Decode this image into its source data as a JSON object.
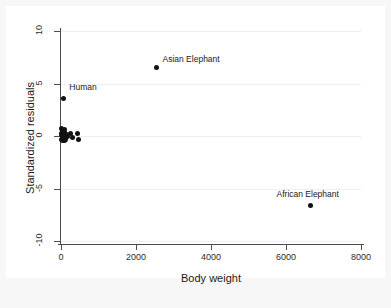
{
  "chart_data": {
    "type": "scatter",
    "title": "",
    "subtitle": "",
    "xlabel": "Body weight",
    "ylabel": "Standardized residuals",
    "xlim": [
      0,
      8000
    ],
    "ylim": [
      -10,
      10
    ],
    "xticks": [
      0,
      2000,
      4000,
      6000,
      8000
    ],
    "xticklabels": [
      "0",
      "2000",
      "4000",
      "6000",
      "8000"
    ],
    "yticks": [
      10,
      5,
      0,
      -5,
      -10
    ],
    "yticklabels": [
      "10",
      "5",
      "0",
      "-5",
      "-10"
    ],
    "grid": "horizontal",
    "legend": "none",
    "marker_color": "#111111",
    "points": [
      {
        "x": 2547,
        "y": 6.5,
        "label": "Asian Elephant",
        "label_dx": 6,
        "label_dy": -9
      },
      {
        "x": 62,
        "y": 3.6,
        "label": "Human",
        "label_dx": 6,
        "label_dy": -11
      },
      {
        "x": 6654,
        "y": -6.6,
        "label": "African Elephant",
        "label_dx": -34,
        "label_dy": -11
      },
      {
        "x": 10,
        "y": 0.75,
        "label": "",
        "label_dx": 0,
        "label_dy": 0
      },
      {
        "x": 35,
        "y": 0.55,
        "label": "",
        "label_dx": 0,
        "label_dy": 0
      },
      {
        "x": 60,
        "y": 0.35,
        "label": "",
        "label_dx": 0,
        "label_dy": 0
      },
      {
        "x": 85,
        "y": 0.6,
        "label": "",
        "label_dx": 0,
        "label_dy": 0
      },
      {
        "x": 105,
        "y": 0.3,
        "label": "",
        "label_dx": 0,
        "label_dy": 0
      },
      {
        "x": 120,
        "y": 0.05,
        "label": "",
        "label_dx": 0,
        "label_dy": 0
      },
      {
        "x": 20,
        "y": 0.1,
        "label": "",
        "label_dx": 0,
        "label_dy": 0
      },
      {
        "x": 45,
        "y": -0.1,
        "label": "",
        "label_dx": 0,
        "label_dy": 0
      },
      {
        "x": 70,
        "y": -0.05,
        "label": "",
        "label_dx": 0,
        "label_dy": 0
      },
      {
        "x": 95,
        "y": -0.2,
        "label": "",
        "label_dx": 0,
        "label_dy": 0
      },
      {
        "x": 15,
        "y": -0.35,
        "label": "",
        "label_dx": 0,
        "label_dy": 0
      },
      {
        "x": 50,
        "y": -0.45,
        "label": "",
        "label_dx": 0,
        "label_dy": 0
      },
      {
        "x": 80,
        "y": -0.4,
        "label": "",
        "label_dx": 0,
        "label_dy": 0
      },
      {
        "x": 5,
        "y": 0.2,
        "label": "",
        "label_dx": 0,
        "label_dy": 0
      },
      {
        "x": 30,
        "y": -0.25,
        "label": "",
        "label_dx": 0,
        "label_dy": 0
      },
      {
        "x": 130,
        "y": -0.3,
        "label": "",
        "label_dx": 0,
        "label_dy": 0
      },
      {
        "x": 155,
        "y": 0.15,
        "label": "",
        "label_dx": 0,
        "label_dy": 0
      },
      {
        "x": 185,
        "y": 0.0,
        "label": "",
        "label_dx": 0,
        "label_dy": 0
      },
      {
        "x": 250,
        "y": 0.2,
        "label": "",
        "label_dx": 0,
        "label_dy": 0
      },
      {
        "x": 300,
        "y": -0.15,
        "label": "",
        "label_dx": 0,
        "label_dy": 0
      },
      {
        "x": 440,
        "y": 0.25,
        "label": "",
        "label_dx": 0,
        "label_dy": 0
      },
      {
        "x": 465,
        "y": -0.3,
        "label": "",
        "label_dx": 0,
        "label_dy": 0
      }
    ]
  }
}
